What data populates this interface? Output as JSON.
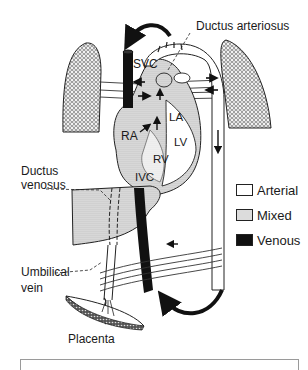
{
  "diagram": {
    "labels": {
      "svc": "SVC",
      "ductus_arteriosus": "Ductus arteriosus",
      "ra": "RA",
      "la": "LA",
      "lv": "LV",
      "rv": "RV",
      "ivc": "IVC",
      "ductus_venosus_line1": "Ductus",
      "ductus_venosus_line2": "venosus",
      "umbilical_vein_line1": "Umbilical",
      "umbilical_vein_line2": "vein",
      "placenta": "Placenta"
    },
    "structures": [
      "left-lung",
      "right-lung",
      "heart",
      "superior-vena-cava",
      "inferior-vena-cava",
      "aorta",
      "pulmonary-artery",
      "liver",
      "umbilical-vein",
      "umbilical-arteries",
      "placenta"
    ]
  },
  "legend": {
    "items": [
      {
        "label": "Arterial",
        "fill": "#ffffff"
      },
      {
        "label": "Mixed",
        "fill": "#dcdcdc"
      },
      {
        "label": "Venous",
        "fill": "#111111"
      }
    ]
  }
}
